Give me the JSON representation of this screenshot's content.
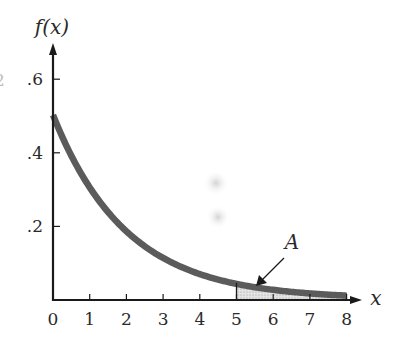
{
  "chart_data": {
    "type": "line",
    "title": "",
    "function": "f(x) = 0.5 e^{-0.5x}",
    "xlabel": "x",
    "ylabel": "f(x)",
    "xlim": [
      0,
      8
    ],
    "ylim": [
      0,
      0.6
    ],
    "x_ticks": [
      0,
      1,
      2,
      3,
      4,
      5,
      6,
      7,
      8
    ],
    "x_tick_labels": [
      "0",
      "1",
      "2",
      "3",
      "4",
      "5",
      "6",
      "7",
      "8"
    ],
    "y_ticks": [
      0.2,
      0.4,
      0.6
    ],
    "y_tick_labels": [
      ".2",
      ".4",
      ".6"
    ],
    "grid": false,
    "legend": null,
    "series": [
      {
        "name": "f(x)",
        "x": [
          0,
          0.5,
          1,
          1.5,
          2,
          2.5,
          3,
          3.5,
          4,
          4.5,
          5,
          5.5,
          6,
          6.5,
          7,
          7.5,
          8
        ],
        "values": [
          0.5,
          0.389,
          0.303,
          0.236,
          0.184,
          0.143,
          0.112,
          0.087,
          0.068,
          0.053,
          0.041,
          0.032,
          0.025,
          0.019,
          0.015,
          0.012,
          0.009
        ]
      }
    ],
    "shaded_region": {
      "label": "A",
      "x_from": 5,
      "x_to": 8
    },
    "annotations": [
      {
        "text": "A",
        "points_to": "shaded area under curve for x >= 5"
      }
    ]
  },
  "labels": {
    "y_axis_title": "f(x)",
    "x_axis_title": "x",
    "region_label": "A",
    "edge_fragment": "2"
  }
}
